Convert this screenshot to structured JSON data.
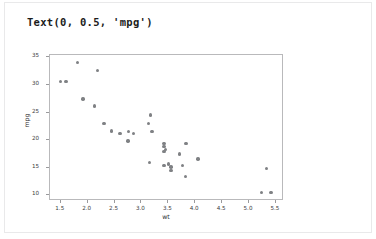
{
  "cell": {
    "repr_text": "Text(0, 0.5, 'mpg')"
  },
  "chart_data": {
    "type": "scatter",
    "title": "",
    "xlabel": "wt",
    "ylabel": "mpg",
    "xlim": [
      1.3,
      5.65
    ],
    "ylim": [
      9.0,
      35.4
    ],
    "xticks": [
      "1.5",
      "2.0",
      "2.5",
      "3.0",
      "3.5",
      "4.0",
      "4.5",
      "5.0",
      "5.5"
    ],
    "xtick_values": [
      1.5,
      2.0,
      2.5,
      3.0,
      3.5,
      4.0,
      4.5,
      5.0,
      5.5
    ],
    "yticks": [
      "10",
      "15",
      "20",
      "25",
      "30",
      "35"
    ],
    "ytick_values": [
      10,
      15,
      20,
      25,
      30,
      35
    ],
    "grid": false,
    "legend": false,
    "marker_color": "#7f8184",
    "marker_size": 3.4,
    "series": [
      {
        "name": "mtcars",
        "x": [
          2.62,
          2.875,
          2.32,
          3.215,
          3.44,
          3.46,
          3.57,
          3.19,
          3.15,
          3.44,
          3.44,
          4.07,
          3.73,
          3.78,
          5.25,
          5.424,
          5.345,
          2.2,
          1.615,
          1.835,
          2.465,
          3.52,
          3.435,
          3.84,
          3.845,
          1.935,
          2.14,
          1.513,
          3.17,
          2.77,
          3.57,
          2.78
        ],
        "y": [
          21.0,
          21.0,
          22.8,
          21.4,
          18.7,
          18.1,
          14.3,
          24.4,
          22.8,
          19.2,
          17.8,
          16.4,
          17.3,
          15.2,
          10.4,
          10.4,
          14.7,
          32.4,
          30.4,
          33.9,
          21.5,
          15.5,
          15.2,
          13.3,
          19.2,
          27.3,
          26.0,
          30.4,
          15.8,
          19.7,
          15.0,
          21.4
        ]
      }
    ]
  }
}
